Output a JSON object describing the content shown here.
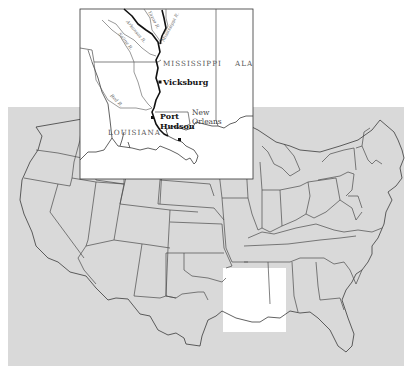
{
  "colors": {
    "background_page": "#ffffff",
    "us_map_fill": "#d9d9d9",
    "highlight_region": "#ffffff",
    "border_lines": "#4a4a4a",
    "mississippi_river": "#111111",
    "label_text": "#555555"
  },
  "us_map": {
    "highlight_region_label": "Lower Mississippi region (Louisiana & Mississippi)"
  },
  "inset": {
    "states": [
      {
        "id": "mississippi",
        "label": "MISSISSIPPI"
      },
      {
        "id": "louisiana",
        "label": "LOUISIANA"
      },
      {
        "id": "alabama",
        "label": "ALA"
      }
    ],
    "rivers": [
      {
        "id": "yazoo",
        "label": "Yazoo R."
      },
      {
        "id": "arkansas",
        "label": "Arkansas R."
      },
      {
        "id": "saline",
        "label": "Saline R."
      },
      {
        "id": "mississippi",
        "label": "Mississippi R."
      },
      {
        "id": "red",
        "label": "Red R."
      }
    ],
    "cities": [
      {
        "id": "vicksburg",
        "label": "Vicksburg"
      },
      {
        "id": "port-hudson-1",
        "label": "Port"
      },
      {
        "id": "port-hudson-2",
        "label": "Hudson"
      },
      {
        "id": "new-orleans-1",
        "label": "New"
      },
      {
        "id": "new-orleans-2",
        "label": "Orleans"
      }
    ]
  }
}
